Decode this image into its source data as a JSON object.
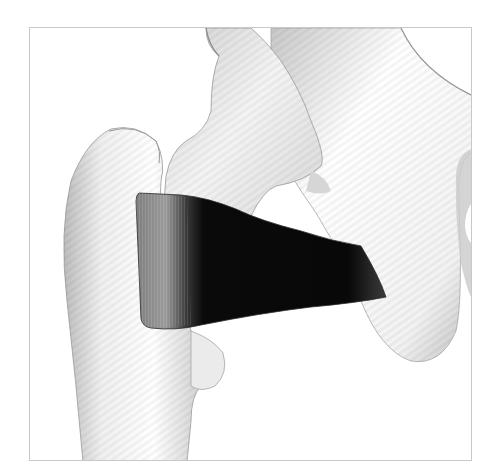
{
  "figure": {
    "background_color": "#ffffff",
    "frame_color": "#c8c8c8",
    "bone_color": "#f4f4f4",
    "bone_shade_color": "#9a9a9a",
    "muscle_color": "#0a0a0a",
    "muscle_origin_color": "#8c8c8c",
    "parts": [
      {
        "id": "femur",
        "label": "Femur"
      },
      {
        "id": "greater-trochanter",
        "label": "Greater trochanter"
      },
      {
        "id": "femoral-neck",
        "label": "Femoral neck"
      },
      {
        "id": "lesser-trochanter",
        "label": "Lesser trochanter"
      },
      {
        "id": "pelvis",
        "label": "Pelvis (ischium)"
      },
      {
        "id": "obturator-foramen",
        "label": "Obturator foramen"
      },
      {
        "id": "muscle",
        "label": "Quadratus femoris"
      }
    ]
  }
}
